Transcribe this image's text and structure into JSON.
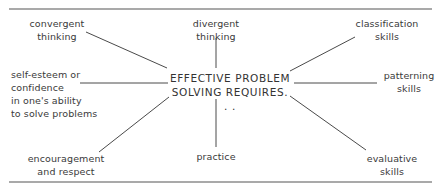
{
  "diagram": {
    "center": {
      "line1": "EFFECTIVE PROBLEM",
      "line2": "SOLVING REQUIRES. . ."
    },
    "nodes": {
      "convergent": {
        "line1": "convergent",
        "line2": "thinking"
      },
      "divergent": {
        "line1": "divergent",
        "line2": "thinking"
      },
      "classification": {
        "line1": "classification",
        "line2": "skills"
      },
      "self_esteem": {
        "line1": "self-esteem or",
        "line2": "confidence",
        "line3": "in one's ability",
        "line4": "to solve problems"
      },
      "patterning": {
        "line1": "patterning",
        "line2": "skills"
      },
      "encouragement": {
        "line1": "encouragement",
        "line2": "and respect"
      },
      "practice": {
        "line1": "practice"
      },
      "evaluative": {
        "line1": "evaluative",
        "line2": "skills"
      }
    },
    "colors": {
      "line": "#4a4a4a",
      "rule": "#555555",
      "text": "#3a3a3a"
    }
  }
}
